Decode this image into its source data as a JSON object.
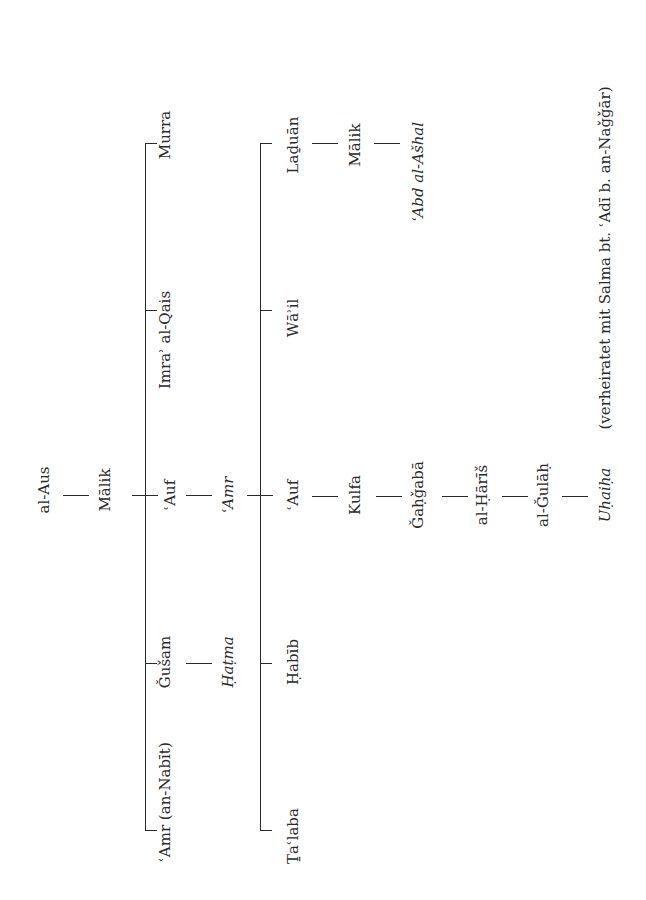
{
  "diagram": {
    "type": "genealogical-tree",
    "orientation": "rotated-90-ccw",
    "ink_color": "#2a2a2a",
    "nodes": [
      {
        "id": "al-aus",
        "label": "al-Aus",
        "x": 44,
        "y": 490,
        "italic": false
      },
      {
        "id": "malik-1",
        "label": "Mālik",
        "x": 105,
        "y": 490,
        "italic": false
      },
      {
        "id": "murra",
        "label": "Murra",
        "x": 165,
        "y": 135,
        "italic": false
      },
      {
        "id": "imra-al-qais",
        "label": "Imraʾ al-Qais",
        "x": 165,
        "y": 340,
        "italic": false
      },
      {
        "id": "auf-1",
        "label": "ʿAuf",
        "x": 170,
        "y": 495,
        "italic": false
      },
      {
        "id": "gusam",
        "label": "Ǧušam",
        "x": 165,
        "y": 662,
        "italic": false
      },
      {
        "id": "amr-an-nabit",
        "label": "ʿAmr (an-Nabīt)",
        "x": 165,
        "y": 802,
        "italic": false
      },
      {
        "id": "amr",
        "label": "ʿAmr",
        "x": 228,
        "y": 495,
        "italic": true
      },
      {
        "id": "hatma",
        "label": "Ḥaṭma",
        "x": 228,
        "y": 662,
        "italic": true
      },
      {
        "id": "laduan",
        "label": "Laḏuān",
        "x": 293,
        "y": 145,
        "italic": false
      },
      {
        "id": "wail",
        "label": "Wāʾil",
        "x": 293,
        "y": 318,
        "italic": false
      },
      {
        "id": "auf-2",
        "label": "ʿAuf",
        "x": 293,
        "y": 495,
        "italic": false
      },
      {
        "id": "habib",
        "label": "Ḥabīb",
        "x": 293,
        "y": 662,
        "italic": false
      },
      {
        "id": "talaba",
        "label": "Ṯaʿlaba",
        "x": 293,
        "y": 836,
        "italic": false
      },
      {
        "id": "malik-2",
        "label": "Mālik",
        "x": 355,
        "y": 145,
        "italic": false
      },
      {
        "id": "abd-al-ashal",
        "label": "ʿAbd al-Ašhal",
        "x": 418,
        "y": 172,
        "italic": true
      },
      {
        "id": "kulfa",
        "label": "Kulfa",
        "x": 355,
        "y": 495,
        "italic": false
      },
      {
        "id": "gahgaba",
        "label": "Ǧaḥǧabā",
        "x": 418,
        "y": 495,
        "italic": false
      },
      {
        "id": "al-haris",
        "label": "al-Ḥārīš",
        "x": 482,
        "y": 495,
        "italic": false
      },
      {
        "id": "al-gulah",
        "label": "al-Ǧulāḥ",
        "x": 543,
        "y": 495,
        "italic": false
      },
      {
        "id": "uhaiha",
        "label": "Uḥaiḥa",
        "x": 605,
        "y": 495,
        "italic": true
      },
      {
        "id": "uhaiha-note",
        "label": "(verheiratet mit Salma bt. ʿAdī b. an-Naǧǧār)",
        "x": 605,
        "y": 258,
        "italic": false
      }
    ],
    "edges": [
      {
        "from": "al-aus",
        "to": "malik-1"
      },
      {
        "from": "malik-1",
        "to": "auf-1"
      },
      {
        "from": "malik-1",
        "to": "murra"
      },
      {
        "from": "malik-1",
        "to": "imra-al-qais"
      },
      {
        "from": "malik-1",
        "to": "gusam"
      },
      {
        "from": "malik-1",
        "to": "amr-an-nabit"
      },
      {
        "from": "auf-1",
        "to": "amr"
      },
      {
        "from": "gusam",
        "to": "hatma"
      },
      {
        "from": "amr",
        "to": "laduan"
      },
      {
        "from": "amr",
        "to": "wail"
      },
      {
        "from": "amr",
        "to": "auf-2"
      },
      {
        "from": "amr",
        "to": "habib"
      },
      {
        "from": "amr",
        "to": "talaba"
      },
      {
        "from": "laduan",
        "to": "malik-2"
      },
      {
        "from": "malik-2",
        "to": "abd-al-ashal"
      },
      {
        "from": "auf-2",
        "to": "kulfa"
      },
      {
        "from": "kulfa",
        "to": "gahgaba"
      },
      {
        "from": "gahgaba",
        "to": "al-haris"
      },
      {
        "from": "al-haris",
        "to": "al-gulah"
      },
      {
        "from": "al-gulah",
        "to": "uhaiha"
      }
    ]
  }
}
